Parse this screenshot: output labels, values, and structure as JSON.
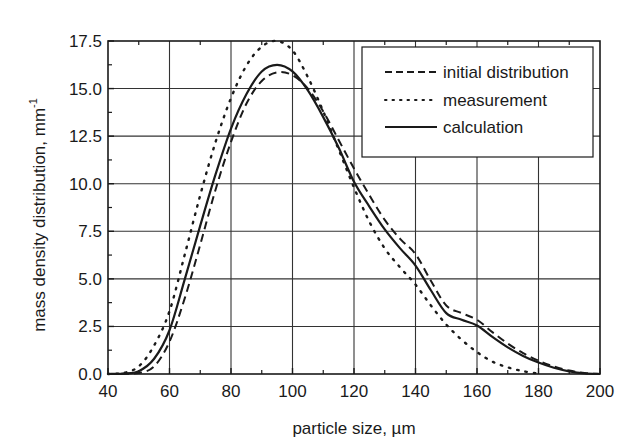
{
  "chart_data": {
    "type": "line",
    "title": "",
    "xlabel": "particle size, µm",
    "ylabel": "mass density distribution, mm",
    "ylabel_superscript": "-1",
    "xlim": [
      40,
      200
    ],
    "ylim": [
      0,
      17.5
    ],
    "xticks": [
      40,
      60,
      80,
      100,
      120,
      140,
      160,
      180,
      200
    ],
    "xtick_labels": [
      "40",
      "60",
      "80",
      "100",
      "120",
      "140",
      "160",
      "180",
      "200"
    ],
    "yticks": [
      0,
      2.5,
      5,
      7.5,
      10,
      12.5,
      15,
      17.5
    ],
    "ytick_labels": [
      "0.0",
      "2.5",
      "5.0",
      "7.5",
      "10.0",
      "12.5",
      "15.0",
      "17.5"
    ],
    "grid": true,
    "legend_position": "upper right",
    "series": [
      {
        "name": "initial distribution",
        "style": "dashed",
        "x": [
          40,
          45,
          50,
          55,
          60,
          65,
          70,
          75,
          80,
          85,
          90,
          95,
          100,
          105,
          110,
          115,
          120,
          125,
          130,
          135,
          140,
          145,
          150,
          155,
          160,
          165,
          170,
          175,
          180,
          185,
          190,
          195,
          200
        ],
        "values": [
          0,
          0.01,
          0.05,
          0.4,
          1.7,
          4.0,
          6.8,
          9.7,
          12.2,
          14.2,
          15.4,
          15.85,
          15.7,
          15.0,
          13.8,
          12.3,
          10.8,
          9.4,
          8.1,
          7.1,
          6.3,
          4.9,
          3.6,
          3.2,
          2.85,
          2.2,
          1.6,
          1.1,
          0.7,
          0.4,
          0.18,
          0.05,
          0
        ]
      },
      {
        "name": "measurement",
        "style": "dotted",
        "x": [
          40,
          45,
          50,
          55,
          60,
          65,
          70,
          75,
          80,
          85,
          90,
          95,
          100,
          105,
          110,
          115,
          120,
          125,
          130,
          135,
          140,
          145,
          150,
          155,
          160,
          165,
          170,
          175,
          180
        ],
        "values": [
          0,
          0.05,
          0.4,
          1.5,
          3.3,
          6.3,
          9.4,
          12.2,
          14.5,
          16.2,
          17.2,
          17.5,
          17.0,
          15.6,
          13.8,
          11.8,
          9.8,
          8.0,
          6.6,
          5.6,
          4.7,
          3.6,
          2.6,
          1.8,
          1.15,
          0.65,
          0.35,
          0.15,
          0.02
        ]
      },
      {
        "name": "calculation",
        "style": "solid",
        "x": [
          40,
          45,
          50,
          55,
          60,
          65,
          70,
          75,
          80,
          85,
          90,
          95,
          100,
          105,
          110,
          115,
          120,
          125,
          130,
          135,
          140,
          145,
          150,
          155,
          160,
          165,
          170,
          175,
          180,
          185,
          190,
          195,
          200
        ],
        "values": [
          0,
          0.02,
          0.15,
          0.8,
          2.3,
          5.0,
          7.8,
          10.5,
          12.9,
          14.7,
          15.9,
          16.25,
          15.9,
          14.9,
          13.5,
          11.9,
          10.1,
          8.8,
          7.6,
          6.6,
          5.7,
          4.4,
          3.2,
          2.85,
          2.55,
          1.95,
          1.4,
          0.95,
          0.6,
          0.33,
          0.14,
          0.03,
          0
        ]
      }
    ]
  },
  "legend": {
    "items": [
      {
        "label": "initial distribution",
        "style": "dashed"
      },
      {
        "label": "measurement",
        "style": "dotted"
      },
      {
        "label": "calculation",
        "style": "solid"
      }
    ]
  },
  "colors": {
    "line": "#1a1a1a",
    "grid": "#333333",
    "background": "#ffffff"
  }
}
